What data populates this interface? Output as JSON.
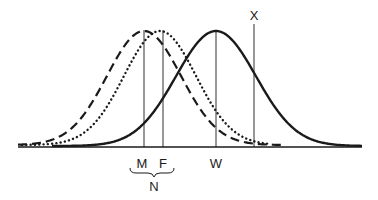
{
  "diagram": {
    "type": "overlapping-distributions",
    "colors": {
      "ink": "#1a1a1a",
      "background": "#ffffff"
    },
    "curves": [
      {
        "id": "M",
        "style": "dashed",
        "peak_label": "M"
      },
      {
        "id": "F",
        "style": "dotted",
        "peak_label": "F"
      },
      {
        "id": "W",
        "style": "solid",
        "peak_label": "W"
      }
    ],
    "markers": [
      {
        "label": "M",
        "position": "under-axis"
      },
      {
        "label": "F",
        "position": "under-axis"
      },
      {
        "label": "W",
        "position": "under-axis"
      },
      {
        "label": "X",
        "position": "above-line"
      }
    ],
    "group_brace": {
      "spans": [
        "M",
        "F"
      ],
      "label": "N"
    }
  },
  "labels": {
    "m": "M",
    "f": "F",
    "w": "W",
    "x": "X",
    "n": "N"
  }
}
